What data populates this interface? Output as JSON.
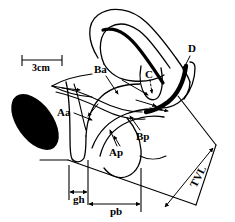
{
  "figure": {
    "background_color": "#ffffff",
    "line_color": "#000000",
    "width_px": 235,
    "height_px": 222
  },
  "scale_bar": {
    "label": "3cm",
    "x_start_px": 22,
    "x_end_px": 62,
    "y_px": 60
  },
  "labels": {
    "ba": "Ba",
    "c": "C",
    "d": "D",
    "aa": "Aa",
    "ap": "Ap",
    "bp": "Bp",
    "tvl": "TVL",
    "gh": "gh",
    "pb": "pb"
  },
  "measurements": [
    {
      "id": "gh",
      "label": "gh",
      "orientation": "horizontal"
    },
    {
      "id": "pb",
      "label": "pb",
      "orientation": "horizontal"
    },
    {
      "id": "tvl",
      "label": "TVL",
      "orientation": "diagonal"
    }
  ],
  "landmark_points": [
    {
      "id": "Aa",
      "label": "Aa",
      "description": "anterior vaginal wall point A"
    },
    {
      "id": "Ba",
      "label": "Ba",
      "description": "anterior vaginal wall point B"
    },
    {
      "id": "C",
      "label": "C",
      "description": "cervix or vaginal cuff"
    },
    {
      "id": "D",
      "label": "D",
      "description": "posterior fornix"
    },
    {
      "id": "Ap",
      "label": "Ap",
      "description": "posterior vaginal wall point A"
    },
    {
      "id": "Bp",
      "label": "Bp",
      "description": "posterior vaginal wall point B"
    }
  ]
}
